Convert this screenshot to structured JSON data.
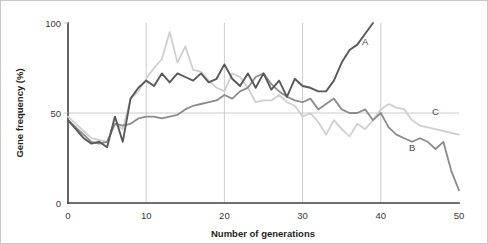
{
  "chart_data": {
    "type": "line",
    "title": "",
    "xlabel": "Number of generations",
    "ylabel": "Gene frequency (%)",
    "xlim": [
      0,
      50
    ],
    "ylim": [
      0,
      100
    ],
    "xticks": [
      0,
      10,
      20,
      30,
      40,
      50
    ],
    "yticks": [
      0,
      50,
      100
    ],
    "xtick_labels": [
      "0",
      "10",
      "20",
      "30",
      "40",
      "50"
    ],
    "ytick_labels": [
      "0",
      "50",
      "100"
    ],
    "grid": "vertical gridlines at 10,20,30,40 plus horizontal gridline at 50",
    "legend": "inline end-of-line labels A, B, C",
    "series": [
      {
        "name": "A",
        "label": "A",
        "color": "#595959",
        "label_x": 38,
        "label_y": 88,
        "x": [
          0,
          1,
          2,
          3,
          4,
          5,
          6,
          7,
          8,
          9,
          10,
          11,
          12,
          13,
          14,
          15,
          16,
          17,
          18,
          19,
          20,
          21,
          22,
          23,
          24,
          25,
          26,
          27,
          28,
          29,
          30,
          31,
          32,
          33,
          34,
          35,
          36,
          37,
          38,
          39
        ],
        "values": [
          46,
          41,
          36,
          33,
          34,
          31,
          48,
          34,
          58,
          64,
          68,
          65,
          72,
          67,
          72,
          70,
          68,
          72,
          67,
          69,
          77,
          69,
          65,
          72,
          64,
          72,
          63,
          68,
          59,
          69,
          65,
          64,
          62,
          62,
          68,
          78,
          85,
          88,
          94,
          100
        ]
      },
      {
        "name": "B",
        "label": "B",
        "color": "#8c8c8c",
        "label_x": 44,
        "label_y": 29,
        "x": [
          0,
          1,
          2,
          3,
          4,
          5,
          6,
          7,
          8,
          9,
          10,
          11,
          12,
          13,
          14,
          15,
          16,
          17,
          18,
          19,
          20,
          21,
          22,
          23,
          24,
          25,
          26,
          27,
          28,
          29,
          30,
          31,
          32,
          33,
          34,
          35,
          36,
          37,
          38,
          39,
          40,
          41,
          42,
          43,
          44,
          45,
          46,
          47,
          48,
          49,
          50
        ],
        "values": [
          46,
          42,
          38,
          34,
          33,
          34,
          44,
          43,
          44,
          47,
          48,
          48,
          47,
          48,
          49,
          52,
          54,
          55,
          56,
          57,
          60,
          58,
          62,
          64,
          70,
          72,
          66,
          62,
          59,
          57,
          56,
          58,
          52,
          55,
          58,
          52,
          50,
          50,
          52,
          46,
          50,
          42,
          38,
          36,
          34,
          36,
          34,
          30,
          34,
          18,
          7
        ]
      },
      {
        "name": "C",
        "label": "C",
        "color": "#cfcfcf",
        "label_x": 47,
        "label_y": 49,
        "x": [
          0,
          1,
          2,
          3,
          4,
          5,
          6,
          7,
          8,
          9,
          10,
          11,
          12,
          13,
          14,
          15,
          16,
          17,
          18,
          19,
          20,
          21,
          22,
          23,
          24,
          25,
          26,
          27,
          28,
          29,
          30,
          31,
          32,
          33,
          34,
          35,
          36,
          37,
          38,
          39,
          40,
          41,
          42,
          43,
          44,
          45,
          46,
          47,
          48,
          49,
          50
        ],
        "values": [
          48,
          44,
          40,
          36,
          35,
          34,
          44,
          41,
          58,
          62,
          69,
          75,
          80,
          95,
          78,
          87,
          74,
          73,
          68,
          64,
          62,
          72,
          70,
          64,
          56,
          57,
          57,
          60,
          56,
          54,
          48,
          50,
          45,
          38,
          46,
          41,
          37,
          44,
          41,
          46,
          52,
          55,
          53,
          52,
          46,
          43,
          42,
          41,
          40,
          39,
          38
        ]
      }
    ]
  },
  "axes": {
    "y_title": "Gene frequency (%)",
    "x_title": "Number of generations"
  }
}
